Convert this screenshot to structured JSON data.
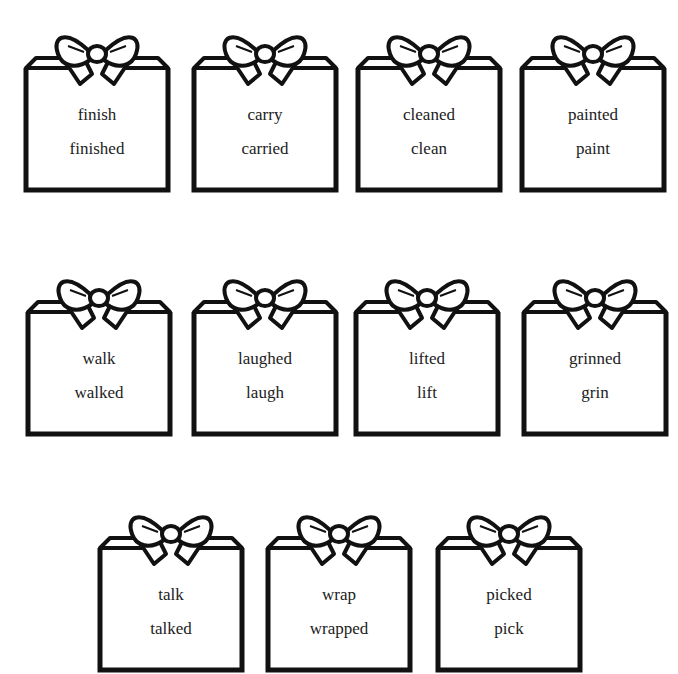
{
  "worksheet": {
    "rows": [
      {
        "tags": [
          {
            "words": [
              "finish",
              "finished"
            ]
          },
          {
            "words": [
              "carry",
              "carried"
            ]
          },
          {
            "words": [
              "cleaned",
              "clean"
            ]
          },
          {
            "words": [
              "painted",
              "paint"
            ]
          }
        ]
      },
      {
        "tags": [
          {
            "words": [
              "walk",
              "walked"
            ]
          },
          {
            "words": [
              "laughed",
              "laugh"
            ]
          },
          {
            "words": [
              "lifted",
              "lift"
            ]
          },
          {
            "words": [
              "grinned",
              "grin"
            ]
          }
        ]
      },
      {
        "tags": [
          {
            "words": [
              "talk",
              "talked"
            ]
          },
          {
            "words": [
              "wrap",
              "wrapped"
            ]
          },
          {
            "words": [
              "picked",
              "pick"
            ]
          }
        ]
      }
    ]
  }
}
